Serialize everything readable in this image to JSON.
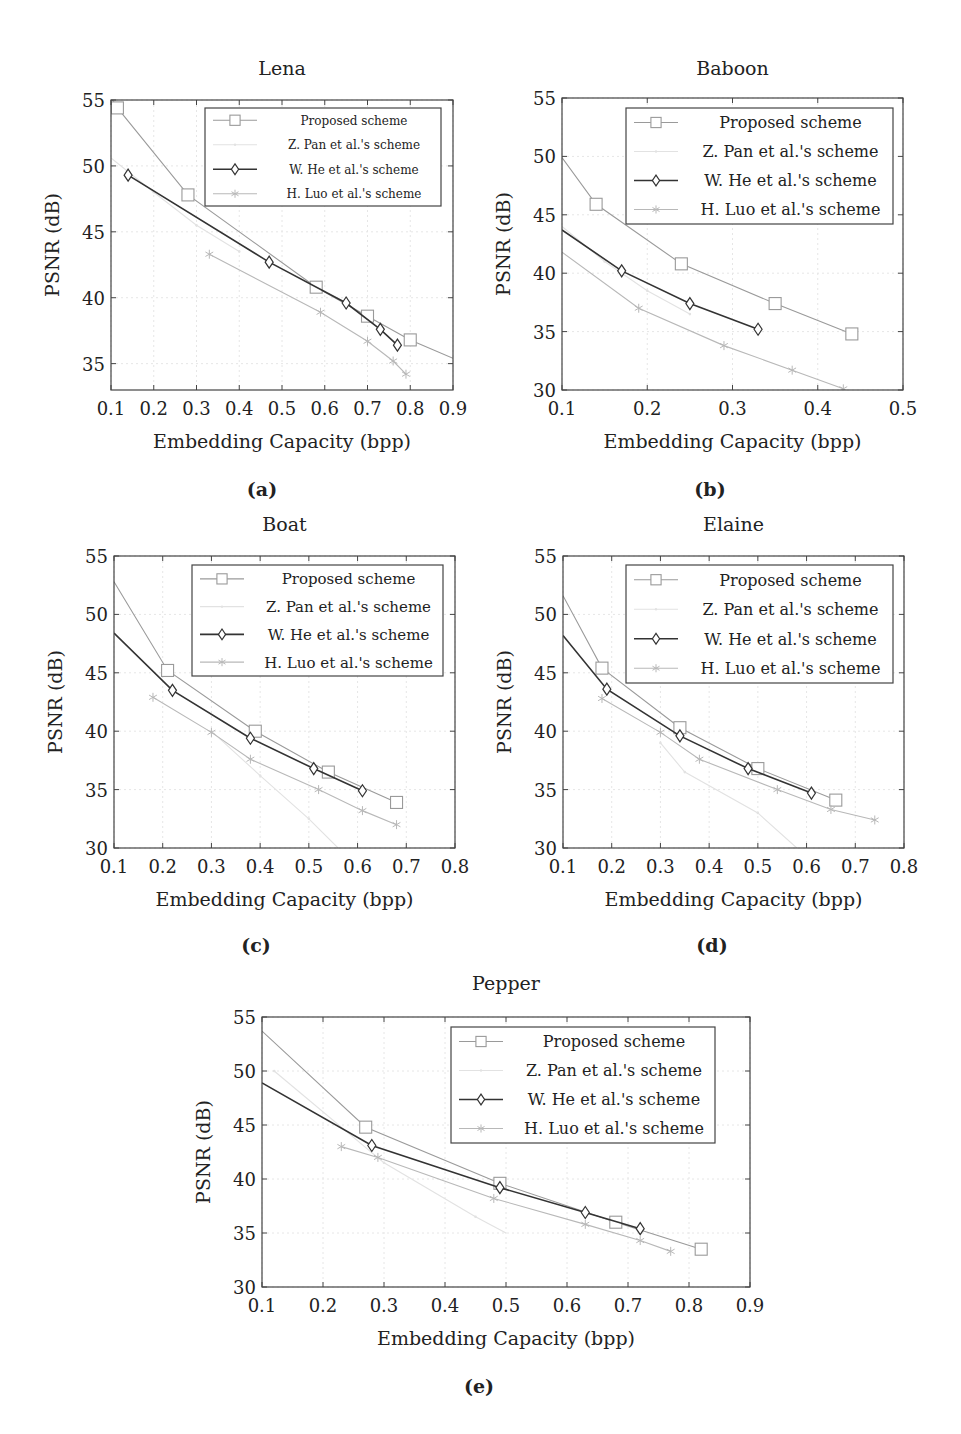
{
  "legend": {
    "proposed": "Proposed scheme",
    "pan": "Z. Pan et al.'s scheme",
    "he": "W. He et al.'s scheme",
    "luo": "H. Luo et al.'s scheme"
  },
  "colors": {
    "proposed": "#9a9a9a",
    "pan": "#e2e2e2",
    "he": "#333333",
    "luo": "#b8b8b8",
    "axis": "#444444",
    "grid": "#e6e6e6"
  },
  "captions": [
    "(a)",
    "(b)",
    "(c)",
    "(d)",
    "(e)"
  ],
  "chart_data": [
    {
      "type": "line",
      "title": "Lena",
      "caption": "(a)",
      "xlabel": "Embedding Capacity (bpp)",
      "ylabel": "PSNR (dB)",
      "xlim": [
        0.1,
        0.9
      ],
      "ylim": [
        33,
        55
      ],
      "xticks": [
        0.1,
        0.2,
        0.3,
        0.4,
        0.5,
        0.6,
        0.7,
        0.8,
        0.9
      ],
      "yticks": [
        35,
        40,
        45,
        50,
        55
      ],
      "grid": true,
      "legend_position": "upper right",
      "series": [
        {
          "name": "Proposed scheme",
          "key": "proposed",
          "marker": "square",
          "x": [
            0.1,
            0.115,
            0.28,
            0.58,
            0.7,
            0.8,
            0.9
          ],
          "y": [
            55.2,
            54.4,
            47.8,
            40.8,
            38.6,
            36.8,
            35.4
          ],
          "marked": [
            false,
            true,
            true,
            true,
            true,
            true,
            false
          ]
        },
        {
          "name": "Z. Pan et al.'s scheme",
          "key": "pan",
          "marker": "dot",
          "x": [
            0.1,
            0.2,
            0.3,
            0.4
          ],
          "y": [
            50.6,
            48.0,
            45.5,
            43.5
          ],
          "marked": [
            false,
            true,
            true,
            true
          ]
        },
        {
          "name": "W. He et al.'s scheme",
          "key": "he",
          "marker": "diamond",
          "x": [
            0.14,
            0.47,
            0.65,
            0.73,
            0.77
          ],
          "y": [
            49.3,
            42.7,
            39.6,
            37.6,
            36.4
          ],
          "marked": [
            true,
            true,
            true,
            true,
            true
          ]
        },
        {
          "name": "H. Luo et al.'s scheme",
          "key": "luo",
          "marker": "star",
          "x": [
            0.33,
            0.59,
            0.7,
            0.76,
            0.79
          ],
          "y": [
            43.3,
            38.9,
            36.7,
            35.2,
            34.2
          ],
          "marked": [
            true,
            true,
            true,
            true,
            true
          ]
        }
      ]
    },
    {
      "type": "line",
      "title": "Baboon",
      "caption": "(b)",
      "xlabel": "Embedding Capacity (bpp)",
      "ylabel": "PSNR (dB)",
      "xlim": [
        0.1,
        0.5
      ],
      "ylim": [
        30,
        55
      ],
      "xticks": [
        0.1,
        0.2,
        0.3,
        0.4,
        0.5
      ],
      "yticks": [
        30,
        35,
        40,
        45,
        50,
        55
      ],
      "grid": true,
      "legend_position": "upper right",
      "series": [
        {
          "name": "Proposed scheme",
          "key": "proposed",
          "marker": "square",
          "x": [
            0.1,
            0.14,
            0.24,
            0.35,
            0.44
          ],
          "y": [
            49.9,
            45.9,
            40.8,
            37.4,
            34.8
          ],
          "marked": [
            false,
            true,
            true,
            true,
            true
          ]
        },
        {
          "name": "Z. Pan et al.'s scheme",
          "key": "pan",
          "marker": "dot",
          "x": [
            0.1,
            0.15,
            0.2,
            0.25
          ],
          "y": [
            44.0,
            41.0,
            38.5,
            36.5
          ],
          "marked": [
            false,
            true,
            true,
            true
          ]
        },
        {
          "name": "W. He et al.'s scheme",
          "key": "he",
          "marker": "diamond",
          "x": [
            0.1,
            0.17,
            0.25,
            0.33
          ],
          "y": [
            43.7,
            40.2,
            37.4,
            35.2
          ],
          "marked": [
            false,
            true,
            true,
            true
          ]
        },
        {
          "name": "H. Luo et al.'s scheme",
          "key": "luo",
          "marker": "star",
          "x": [
            0.1,
            0.19,
            0.29,
            0.37,
            0.43
          ],
          "y": [
            41.8,
            37.0,
            33.8,
            31.7,
            30.1
          ],
          "marked": [
            false,
            true,
            true,
            true,
            true
          ]
        }
      ]
    },
    {
      "type": "line",
      "title": "Boat",
      "caption": "(c)",
      "xlabel": "Embedding Capacity (bpp)",
      "ylabel": "PSNR (dB)",
      "xlim": [
        0.1,
        0.8
      ],
      "ylim": [
        30,
        55
      ],
      "xticks": [
        0.1,
        0.2,
        0.3,
        0.4,
        0.5,
        0.6,
        0.7,
        0.8
      ],
      "yticks": [
        30,
        35,
        40,
        45,
        50,
        55
      ],
      "grid": true,
      "legend_position": "upper right",
      "series": [
        {
          "name": "Proposed scheme",
          "key": "proposed",
          "marker": "square",
          "x": [
            0.1,
            0.21,
            0.39,
            0.54,
            0.68
          ],
          "y": [
            52.8,
            45.2,
            40.0,
            36.5,
            33.9
          ],
          "marked": [
            false,
            true,
            true,
            true,
            true
          ]
        },
        {
          "name": "Z. Pan et al.'s scheme",
          "key": "pan",
          "marker": "dot",
          "x": [
            0.3,
            0.4,
            0.5,
            0.56
          ],
          "y": [
            40.0,
            36.2,
            32.5,
            30.0
          ],
          "marked": [
            true,
            true,
            true,
            false
          ]
        },
        {
          "name": "W. He et al.'s scheme",
          "key": "he",
          "marker": "diamond",
          "x": [
            0.1,
            0.22,
            0.38,
            0.51,
            0.61
          ],
          "y": [
            48.4,
            43.5,
            39.4,
            36.8,
            34.9
          ],
          "marked": [
            false,
            true,
            true,
            true,
            true
          ]
        },
        {
          "name": "H. Luo et al.'s scheme",
          "key": "luo",
          "marker": "star",
          "x": [
            0.18,
            0.3,
            0.38,
            0.52,
            0.61,
            0.68
          ],
          "y": [
            42.9,
            39.9,
            37.6,
            35.0,
            33.2,
            32.0
          ],
          "marked": [
            true,
            true,
            true,
            true,
            true,
            true
          ]
        }
      ]
    },
    {
      "type": "line",
      "title": "Elaine",
      "caption": "(d)",
      "xlabel": "Embedding Capacity (bpp)",
      "ylabel": "PSNR (dB)",
      "xlim": [
        0.1,
        0.8
      ],
      "ylim": [
        30,
        55
      ],
      "xticks": [
        0.1,
        0.2,
        0.3,
        0.4,
        0.5,
        0.6,
        0.7,
        0.8
      ],
      "yticks": [
        30,
        35,
        40,
        45,
        50,
        55
      ],
      "grid": true,
      "legend_position": "upper right",
      "series": [
        {
          "name": "Proposed scheme",
          "key": "proposed",
          "marker": "square",
          "x": [
            0.1,
            0.18,
            0.34,
            0.5,
            0.66
          ],
          "y": [
            51.6,
            45.4,
            40.3,
            36.8,
            34.1
          ],
          "marked": [
            false,
            true,
            true,
            true,
            true
          ]
        },
        {
          "name": "Z. Pan et al.'s scheme",
          "key": "pan",
          "marker": "dot",
          "x": [
            0.3,
            0.35,
            0.5,
            0.58
          ],
          "y": [
            39.0,
            36.5,
            33.0,
            30.0
          ],
          "marked": [
            true,
            true,
            true,
            false
          ]
        },
        {
          "name": "W. He et al.'s scheme",
          "key": "he",
          "marker": "diamond",
          "x": [
            0.1,
            0.19,
            0.34,
            0.48,
            0.61
          ],
          "y": [
            48.2,
            43.6,
            39.6,
            36.8,
            34.7
          ],
          "marked": [
            false,
            true,
            true,
            true,
            true
          ]
        },
        {
          "name": "H. Luo et al.'s scheme",
          "key": "luo",
          "marker": "star",
          "x": [
            0.18,
            0.3,
            0.38,
            0.54,
            0.65,
            0.74
          ],
          "y": [
            42.8,
            39.9,
            37.6,
            35.0,
            33.3,
            32.4
          ],
          "marked": [
            true,
            true,
            true,
            true,
            true,
            true
          ]
        }
      ]
    },
    {
      "type": "line",
      "title": "Pepper",
      "caption": "(e)",
      "xlabel": "Embedding Capacity (bpp)",
      "ylabel": "PSNR (dB)",
      "xlim": [
        0.1,
        0.9
      ],
      "ylim": [
        30,
        55
      ],
      "xticks": [
        0.1,
        0.2,
        0.3,
        0.4,
        0.5,
        0.6,
        0.7,
        0.8,
        0.9
      ],
      "yticks": [
        30,
        35,
        40,
        45,
        50,
        55
      ],
      "grid": true,
      "legend_position": "upper right",
      "series": [
        {
          "name": "Proposed scheme",
          "key": "proposed",
          "marker": "square",
          "x": [
            0.1,
            0.27,
            0.49,
            0.68,
            0.82
          ],
          "y": [
            53.7,
            44.8,
            39.6,
            36.0,
            33.5
          ],
          "marked": [
            false,
            true,
            true,
            true,
            true
          ]
        },
        {
          "name": "Z. Pan et al.'s scheme",
          "key": "pan",
          "marker": "dot",
          "x": [
            0.12,
            0.3,
            0.45,
            0.5
          ],
          "y": [
            50.0,
            41.5,
            36.5,
            35.0
          ],
          "marked": [
            true,
            true,
            true,
            false
          ]
        },
        {
          "name": "W. He et al.'s scheme",
          "key": "he",
          "marker": "diamond",
          "x": [
            0.1,
            0.28,
            0.49,
            0.63,
            0.72
          ],
          "y": [
            48.9,
            43.1,
            39.2,
            36.9,
            35.4
          ],
          "marked": [
            false,
            true,
            true,
            true,
            true
          ]
        },
        {
          "name": "H. Luo et al.'s scheme",
          "key": "luo",
          "marker": "star",
          "x": [
            0.23,
            0.29,
            0.48,
            0.63,
            0.72,
            0.77
          ],
          "y": [
            43.0,
            42.0,
            38.2,
            35.8,
            34.3,
            33.3
          ],
          "marked": [
            true,
            true,
            true,
            true,
            true,
            true
          ]
        }
      ]
    }
  ]
}
